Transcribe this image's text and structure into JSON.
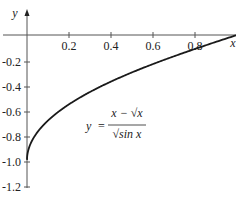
{
  "chart_data": {
    "type": "line",
    "title": "",
    "formula": {
      "lhs": "y",
      "eq": "=",
      "numerator": "x − √x",
      "denominator": "√sin x"
    },
    "xlabel": "x",
    "ylabel": "y",
    "xlim": [
      0,
      1
    ],
    "ylim": [
      -1.2,
      0
    ],
    "grid": false,
    "legend": "none",
    "x_ticks": [
      "0.2",
      "0.4",
      "0.6",
      "0.8"
    ],
    "y_ticks": [
      "-0.2",
      "-0.4",
      "-0.6",
      "-0.8",
      "-1.0",
      "-1.2"
    ],
    "series": [
      {
        "name": "y = (x − √x)/√(sin x)",
        "x": [
          0.001,
          0.01,
          0.05,
          0.1,
          0.2,
          0.3,
          0.4,
          0.5,
          0.6,
          0.7,
          0.8,
          0.9,
          1.0
        ],
        "y": [
          -0.969,
          -0.9,
          -0.777,
          -0.683,
          -0.546,
          -0.438,
          -0.344,
          -0.265,
          -0.193,
          -0.13,
          -0.073,
          -0.025,
          0.0
        ]
      }
    ],
    "color": "#1a1a1a"
  }
}
